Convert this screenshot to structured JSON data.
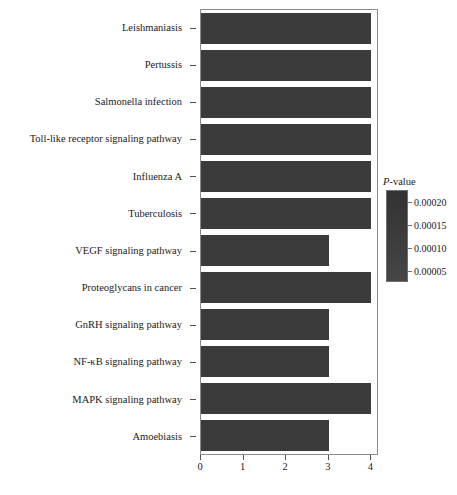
{
  "chart_data": {
    "type": "bar",
    "orientation": "horizontal",
    "title": "",
    "xlabel": "",
    "ylabel": "",
    "xlim": [
      0,
      4.18
    ],
    "xticks": [
      0,
      1,
      2,
      3,
      4
    ],
    "xticklabels": [
      "0",
      "1",
      "2",
      "3",
      "4"
    ],
    "grid": false,
    "bar_color": "#3b3b3b",
    "categories": [
      "Leishmaniasis",
      "Pertussis",
      "Salmonella infection",
      "Toll-like receptor signaling pathway",
      "Influenza A",
      "Tuberculosis",
      "VEGF signaling pathway",
      "Proteoglycans in cancer",
      "GnRH signaling pathway",
      "NF-κB signaling pathway",
      "MAPK signaling pathway",
      "Amoebiasis"
    ],
    "values": [
      4,
      4,
      4,
      4,
      4,
      4,
      3,
      4,
      3,
      3,
      4,
      3
    ],
    "legend": {
      "position": "right",
      "type": "colorbar",
      "title": "P-value",
      "title_italic_prefix": "P",
      "title_rest": "-value",
      "ticks": [
        "0.00020",
        "0.00015",
        "0.00010",
        "0.00005"
      ],
      "gradient_top_color": "#333333",
      "gradient_bottom_color": "#464646"
    }
  },
  "panel": {
    "border_color": "#8a8a8a",
    "background": "#ffffff"
  },
  "caption": {
    "cut_text": ""
  }
}
